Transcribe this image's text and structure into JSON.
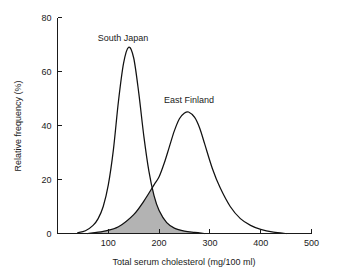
{
  "chart_data": {
    "type": "line",
    "title": "",
    "xlabel": "Total serum cholesterol (mg/100 ml)",
    "ylabel": "Relative frequency (%)",
    "xlim": [
      0,
      500
    ],
    "ylim": [
      0,
      80
    ],
    "xticks": [
      100,
      200,
      300,
      400,
      500
    ],
    "yticks": [
      0,
      20,
      40,
      60,
      80
    ],
    "xtick_labels": [
      "100",
      "200",
      "300",
      "400",
      "500"
    ],
    "ytick_labels": [
      "0",
      "20",
      "40",
      "60",
      "80"
    ],
    "grid": false,
    "legend_position": "inline-annotations",
    "series": [
      {
        "name": "South Japan",
        "label": "South Japan",
        "peak_x": 140,
        "peak_y": 69,
        "color": "#111111",
        "x": [
          40,
          55,
          70,
          80,
          90,
          100,
          110,
          120,
          130,
          140,
          150,
          160,
          170,
          180,
          190,
          200,
          215,
          230,
          250,
          270,
          290
        ],
        "values": [
          0.3,
          1.0,
          3.0,
          5.5,
          10.0,
          18.0,
          31.0,
          49.0,
          63.0,
          69.0,
          65.0,
          52.0,
          36.0,
          23.0,
          14.0,
          8.5,
          4.0,
          2.0,
          0.9,
          0.4,
          0.0
        ]
      },
      {
        "name": "East Finland",
        "label": "East Finland",
        "peak_x": 258,
        "peak_y": 45,
        "color": "#111111",
        "x": [
          60,
          90,
          120,
          150,
          170,
          190,
          200,
          210,
          220,
          230,
          240,
          250,
          258,
          270,
          280,
          290,
          305,
          320,
          340,
          360,
          380,
          400,
          425,
          450
        ],
        "values": [
          0.0,
          0.8,
          2.5,
          7.0,
          12.0,
          18.0,
          21.0,
          26.0,
          32.0,
          38.0,
          42.5,
          44.6,
          45.0,
          43.0,
          39.0,
          33.0,
          24.0,
          17.0,
          10.0,
          5.5,
          3.0,
          1.5,
          0.5,
          0.0
        ]
      }
    ],
    "shaded_overlap": {
      "label": "overlap region",
      "fill_color": "#b3b3b3",
      "apex_x": 197,
      "apex_y": 19,
      "x_start": 60,
      "x_end": 290,
      "description": "Area under the minimum of both distributions"
    }
  },
  "axes": {
    "y_axis_title": "Relative frequency (%)",
    "x_axis_title": "Total serum cholesterol (mg/100 ml)"
  },
  "annotations": {
    "south_japan": "South Japan",
    "east_finland": "East Finland"
  }
}
